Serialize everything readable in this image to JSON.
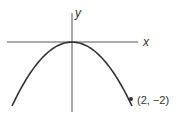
{
  "diagram": {
    "axes": {
      "x_label": "x",
      "y_label": "y"
    },
    "point": {
      "label": "(2, −2)",
      "x": 2,
      "y": -2
    },
    "vertex": {
      "x": 0,
      "y": 0
    },
    "colors": {
      "curve": "#333333",
      "axes": "#444444",
      "text": "#333333"
    }
  }
}
